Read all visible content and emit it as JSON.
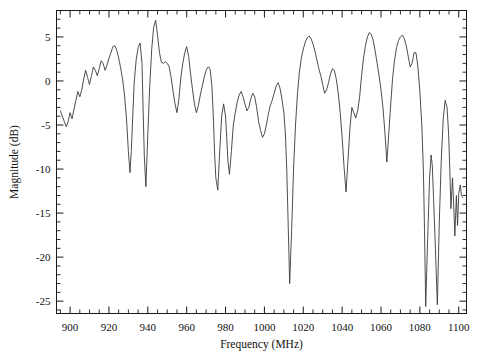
{
  "chart_data": {
    "type": "line",
    "title": "",
    "xlabel": "Frequency (MHz)",
    "ylabel": "Magnitude (dB)",
    "xlim": [
      893,
      1104
    ],
    "ylim": [
      -26.4,
      8.0
    ],
    "xticks": [
      900,
      920,
      940,
      960,
      980,
      1000,
      1020,
      1040,
      1060,
      1080,
      1100
    ],
    "yticks": [
      5,
      0,
      -5,
      -10,
      -15,
      -20,
      -25
    ],
    "xtick_labels": [
      "900",
      "920",
      "940",
      "960",
      "980",
      "1000",
      "1020",
      "1040",
      "1060",
      "1080",
      "1100"
    ],
    "ytick_labels": [
      "5",
      "0",
      "-5",
      "-10",
      "-15",
      "-20",
      "-25"
    ],
    "x_minor_interval": 5,
    "y_minor_interval": 1,
    "grid": false,
    "legend": null,
    "line_color": "#3a3a3a",
    "series": [
      {
        "name": "Magnitude",
        "x": [
          895.0,
          896.0,
          897.0,
          898.0,
          899.0,
          900.0,
          901.0,
          902.0,
          903.0,
          904.0,
          905.0,
          906.0,
          907.0,
          908.0,
          909.0,
          910.0,
          911.0,
          912.0,
          913.0,
          914.0,
          915.0,
          916.0,
          917.0,
          918.0,
          919.0,
          920.0,
          921.0,
          922.0,
          923.0,
          924.0,
          925.0,
          926.0,
          927.0,
          928.0,
          929.0,
          930.0,
          930.8,
          931.5,
          932.2,
          933.0,
          934.0,
          935.0,
          936.0,
          937.0,
          937.6,
          938.2,
          939.0,
          940.0,
          941.0,
          942.0,
          943.0,
          944.0,
          945.0,
          946.0,
          947.0,
          948.0,
          949.0,
          950.0,
          951.0,
          952.0,
          953.0,
          954.0,
          955.0,
          956.0,
          957.0,
          958.0,
          959.0,
          960.0,
          961.0,
          962.0,
          963.0,
          964.0,
          965.0,
          966.0,
          967.0,
          968.0,
          969.0,
          970.0,
          971.0,
          972.0,
          973.0,
          973.8,
          974.4,
          975.0,
          976.0,
          977.0,
          978.0,
          979.0,
          980.0,
          980.6,
          981.2,
          982.0,
          983.0,
          984.0,
          985.0,
          986.0,
          987.0,
          988.0,
          989.0,
          990.0,
          991.0,
          992.0,
          993.0,
          994.0,
          995.0,
          996.0,
          997.0,
          998.0,
          999.0,
          1000.0,
          1001.0,
          1002.0,
          1003.0,
          1004.0,
          1005.0,
          1006.0,
          1007.0,
          1008.0,
          1009.0,
          1010.0,
          1010.8,
          1011.5,
          1012.2,
          1013.0,
          1014.0,
          1015.0,
          1016.0,
          1017.0,
          1018.0,
          1019.0,
          1020.0,
          1021.0,
          1022.0,
          1023.0,
          1024.0,
          1025.0,
          1026.0,
          1027.0,
          1028.0,
          1029.0,
          1030.0,
          1031.0,
          1032.0,
          1033.0,
          1034.0,
          1035.0,
          1036.0,
          1037.0,
          1038.0,
          1039.0,
          1040.0,
          1041.0,
          1042.0,
          1043.0,
          1044.0,
          1045.0,
          1046.0,
          1047.0,
          1048.0,
          1049.0,
          1050.0,
          1051.0,
          1052.0,
          1053.0,
          1054.0,
          1055.0,
          1056.0,
          1057.0,
          1058.0,
          1059.0,
          1060.0,
          1061.0,
          1062.0,
          1063.0,
          1064.0,
          1065.0,
          1066.0,
          1067.0,
          1068.0,
          1069.0,
          1070.0,
          1071.0,
          1072.0,
          1073.0,
          1074.0,
          1075.0,
          1076.0,
          1077.0,
          1078.0,
          1079.0,
          1080.0,
          1081.0,
          1081.8,
          1082.4,
          1083.0,
          1084.0,
          1085.0,
          1085.8,
          1086.4,
          1087.0,
          1088.0,
          1089.0,
          1090.0,
          1091.0,
          1092.0,
          1093.0,
          1094.0,
          1094.8,
          1095.4,
          1096.0,
          1096.8,
          1097.4,
          1098.0,
          1098.8,
          1099.4,
          1100.0,
          1100.8,
          1101.4,
          1102.0
        ],
        "y": [
          -3.4,
          -4.0,
          -4.6,
          -5.2,
          -4.6,
          -3.6,
          -4.3,
          -3.2,
          -2.2,
          -1.2,
          -1.8,
          -1.0,
          0.2,
          1.2,
          0.4,
          -0.4,
          0.6,
          1.6,
          1.2,
          0.6,
          1.4,
          2.3,
          2.0,
          1.2,
          1.8,
          2.6,
          3.2,
          3.9,
          4.0,
          3.5,
          2.6,
          1.5,
          0.2,
          -1.6,
          -4.2,
          -8.0,
          -10.4,
          -8.0,
          -4.2,
          -0.2,
          2.4,
          3.8,
          4.3,
          2.0,
          -3.5,
          -8.6,
          -12.0,
          -6.0,
          -0.5,
          3.6,
          6.1,
          6.9,
          5.2,
          3.2,
          2.1,
          2.0,
          2.2,
          2.0,
          1.6,
          0.4,
          -1.2,
          -2.6,
          -3.6,
          -2.0,
          0.4,
          2.0,
          3.2,
          3.9,
          2.8,
          0.8,
          -1.0,
          -2.6,
          -3.6,
          -2.8,
          -1.6,
          -0.6,
          0.4,
          1.2,
          1.6,
          1.4,
          -0.6,
          -4.6,
          -8.4,
          -11.0,
          -12.4,
          -8.0,
          -4.0,
          -2.6,
          -4.0,
          -6.4,
          -9.0,
          -10.6,
          -8.0,
          -5.0,
          -3.6,
          -2.4,
          -1.6,
          -1.2,
          -1.8,
          -2.6,
          -3.4,
          -3.0,
          -2.0,
          -1.4,
          -1.8,
          -3.0,
          -4.6,
          -5.6,
          -6.4,
          -6.0,
          -5.0,
          -3.8,
          -2.8,
          -2.2,
          -1.4,
          -0.6,
          -0.2,
          -0.8,
          -2.0,
          -3.6,
          -6.0,
          -10.0,
          -16.0,
          -23.0,
          -17.0,
          -10.0,
          -5.0,
          -1.5,
          1.0,
          2.6,
          3.6,
          4.4,
          4.9,
          5.1,
          4.8,
          4.2,
          3.4,
          2.4,
          1.4,
          0.6,
          -0.4,
          -1.4,
          -1.0,
          -0.2,
          0.8,
          1.4,
          1.2,
          0.2,
          -1.4,
          -3.6,
          -6.4,
          -9.8,
          -12.6,
          -9.0,
          -5.4,
          -3.0,
          -3.6,
          -4.2,
          -3.4,
          -1.8,
          0.6,
          2.6,
          4.0,
          5.0,
          5.5,
          5.3,
          4.6,
          3.4,
          2.0,
          0.6,
          -1.0,
          -3.0,
          -5.8,
          -9.2,
          -6.0,
          -2.6,
          0.4,
          2.4,
          3.8,
          4.6,
          5.0,
          5.2,
          4.8,
          4.0,
          2.8,
          1.6,
          2.0,
          3.2,
          3.2,
          1.6,
          -1.2,
          -5.0,
          -10.0,
          -17.0,
          -25.6,
          -18.0,
          -11.0,
          -8.4,
          -9.6,
          -13.0,
          -19.0,
          -25.4,
          -16.0,
          -9.0,
          -4.4,
          -2.2,
          -3.0,
          -6.0,
          -10.0,
          -14.5,
          -11.0,
          -14.0,
          -17.6,
          -13.0,
          -16.4,
          -12.8,
          -11.8,
          -13.0,
          -13.2
        ]
      }
    ]
  },
  "axes": {
    "xlabel": "Frequency (MHz)",
    "ylabel": "Magnitude (dB)"
  }
}
